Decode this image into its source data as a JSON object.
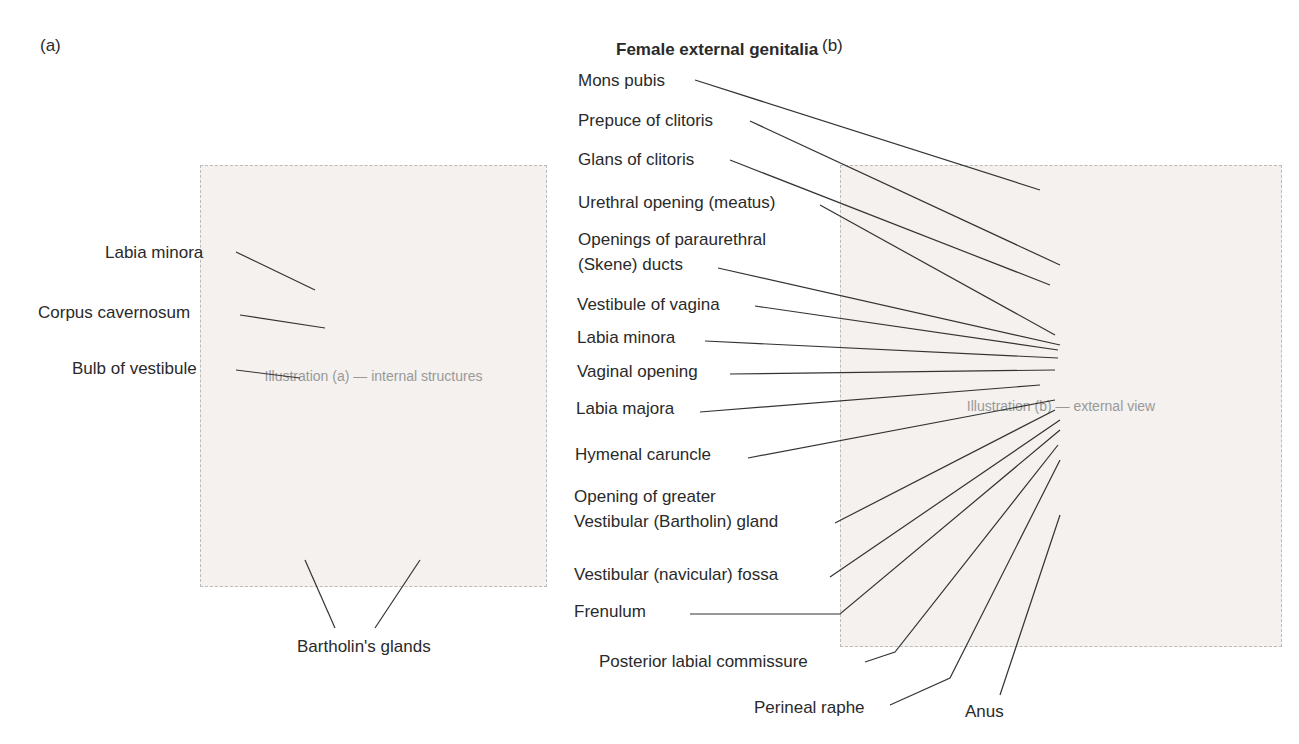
{
  "title": "Female external genitalia",
  "panels": {
    "a": {
      "letter": "(a)",
      "placeholder": "Illustration (a) — internal structures"
    },
    "b": {
      "letter": "(b)",
      "placeholder": "Illustration (b) — external view"
    }
  },
  "labels_a": [
    {
      "text": "Labia minora",
      "x": 105,
      "y": 243
    },
    {
      "text": "Corpus cavernosum",
      "x": 38,
      "y": 303
    },
    {
      "text": "Bulb of vestibule",
      "x": 72,
      "y": 359
    },
    {
      "text": "Bartholin's glands",
      "x": 297,
      "y": 637
    }
  ],
  "labels_b": [
    {
      "text": "Mons pubis",
      "x": 578,
      "y": 71
    },
    {
      "text": "Prepuce of clitoris",
      "x": 578,
      "y": 111
    },
    {
      "text": "Glans of clitoris",
      "x": 578,
      "y": 150
    },
    {
      "text": "Urethral opening (meatus)",
      "x": 578,
      "y": 193
    },
    {
      "text": "Openings of paraurethral",
      "x": 578,
      "y": 230
    },
    {
      "text": "(Skene) ducts",
      "x": 578,
      "y": 255
    },
    {
      "text": "Vestibule of vagina",
      "x": 577,
      "y": 295
    },
    {
      "text": "Labia minora",
      "x": 577,
      "y": 328
    },
    {
      "text": "Vaginal opening",
      "x": 577,
      "y": 362
    },
    {
      "text": "Labia majora",
      "x": 576,
      "y": 399
    },
    {
      "text": "Hymenal caruncle",
      "x": 575,
      "y": 445
    },
    {
      "text": "Opening of greater",
      "x": 574,
      "y": 487
    },
    {
      "text": "Vestibular (Bartholin) gland",
      "x": 574,
      "y": 512
    },
    {
      "text": "Vestibular (navicular) fossa",
      "x": 574,
      "y": 565
    },
    {
      "text": "Frenulum",
      "x": 574,
      "y": 602
    },
    {
      "text": "Posterior labial commissure",
      "x": 599,
      "y": 652
    },
    {
      "text": "Perineal raphe",
      "x": 754,
      "y": 698
    },
    {
      "text": "Anus",
      "x": 965,
      "y": 702
    }
  ]
}
